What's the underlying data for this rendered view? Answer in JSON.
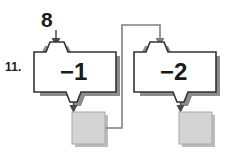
{
  "problem": {
    "number_label": "11."
  },
  "input": {
    "value": "8",
    "arrow_icon": "down-arrow-icon"
  },
  "machines": [
    {
      "id": "machine-1",
      "rule_label": "−1",
      "input_funnel_icon": "funnel-in-icon",
      "output_funnel_icon": "funnel-out-icon",
      "output_arrow_icon": "down-arrow-icon"
    },
    {
      "id": "machine-2",
      "rule_label": "−2",
      "input_funnel_icon": "funnel-in-icon",
      "output_funnel_icon": "funnel-out-icon",
      "output_arrow_icon": "down-arrow-icon"
    }
  ],
  "answer_boxes": [
    {
      "id": "answer-box-1",
      "value": ""
    },
    {
      "id": "answer-box-2",
      "value": ""
    }
  ],
  "connector": {
    "name": "output-1-to-machine-2-connector",
    "arrow_icon": "down-arrow-icon"
  },
  "colors": {
    "outline": "#333333",
    "shadow": "#8c8c8c",
    "machine_fill": "#ffffff",
    "answer_box_fill": "#d4d4d4",
    "answer_box_border": "#a8a8a8",
    "connector_line": "#808080",
    "text": "#1a1a1a",
    "background": "#ffffff"
  }
}
